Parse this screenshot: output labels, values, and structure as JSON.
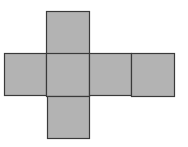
{
  "diagram": {
    "type": "cube-net",
    "fill_color": "#b3b3b3",
    "stroke_color": "#3a3a3a",
    "background": "#ffffff",
    "squares": [
      {
        "id": "top",
        "x": 46,
        "y": 11,
        "size": 43
      },
      {
        "id": "row-1",
        "x": 4,
        "y": 53,
        "size": 42
      },
      {
        "id": "row-2",
        "x": 46,
        "y": 53,
        "size": 43
      },
      {
        "id": "row-3",
        "x": 89,
        "y": 53,
        "size": 42
      },
      {
        "id": "row-4",
        "x": 131,
        "y": 53,
        "size": 43
      },
      {
        "id": "bottom",
        "x": 47,
        "y": 96,
        "size": 42
      }
    ]
  }
}
